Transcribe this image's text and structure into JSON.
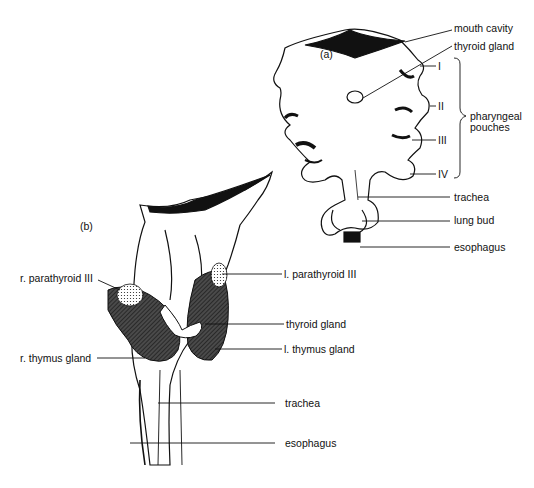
{
  "figure": {
    "panel_a": {
      "label": "(a)",
      "labels": {
        "mouth_cavity": "mouth cavity",
        "thyroid_gland": "thyroid gland",
        "pouch_1": "I",
        "pouch_2": "II",
        "pouch_3": "III",
        "pouch_4": "IV",
        "pharyngeal_pouches_1": "pharyngeal",
        "pharyngeal_pouches_2": "pouches",
        "trachea": "trachea",
        "lung_bud": "lung bud",
        "esophagus": "esophagus"
      }
    },
    "panel_b": {
      "label": "(b)",
      "labels": {
        "r_parathyroid": "r. parathyroid III",
        "l_parathyroid": "l. parathyroid III",
        "thyroid_gland": "thyroid gland",
        "r_thymus": "r. thymus gland",
        "l_thymus": "l. thymus gland",
        "trachea": "trachea",
        "esophagus": "esophagus"
      }
    },
    "colors": {
      "ink": "#111111",
      "gland_fill": "#3a3a3a",
      "background": "#ffffff"
    }
  }
}
